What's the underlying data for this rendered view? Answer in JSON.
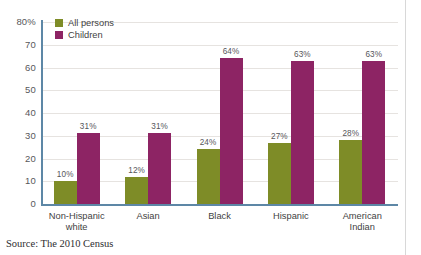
{
  "chart_data": {
    "type": "bar",
    "title": "",
    "xlabel": "",
    "ylabel": "",
    "ylim": [
      0,
      80
    ],
    "yticks": [
      "80%",
      "70",
      "60",
      "50",
      "40",
      "30",
      "20",
      "10",
      "0"
    ],
    "ytick_values": [
      80,
      70,
      60,
      50,
      40,
      30,
      20,
      10,
      0
    ],
    "grid": true,
    "legend_position": "top-left",
    "categories": [
      "Non-Hispanic white",
      "Asian",
      "Black",
      "Hispanic",
      "American Indian"
    ],
    "category_lines": [
      [
        "Non-Hispanic",
        "white"
      ],
      [
        "Asian"
      ],
      [
        "Black"
      ],
      [
        "Hispanic"
      ],
      [
        "American",
        "Indian"
      ]
    ],
    "series": [
      {
        "name": "All persons",
        "color": "#7e8c27",
        "values": [
          10,
          12,
          24,
          27,
          28
        ],
        "labels": [
          "10%",
          "12%",
          "24%",
          "27%",
          "28%"
        ]
      },
      {
        "name": "Children",
        "color": "#8d2464",
        "values": [
          31,
          31,
          64,
          63,
          63
        ],
        "labels": [
          "31%",
          "31%",
          "64%",
          "63%",
          "63%"
        ]
      }
    ]
  },
  "legend": {
    "items": [
      {
        "label": "All persons",
        "color": "#7e8c27"
      },
      {
        "label": "Children",
        "color": "#8d2464"
      }
    ]
  },
  "source_note": "Source: The 2010 Census",
  "colors": {
    "all_persons": "#7e8c27",
    "children": "#8d2464",
    "axis": "#5d87a6",
    "gridline": "#e6e3e0",
    "text": "#3f3f42",
    "background": "#ffffff"
  }
}
